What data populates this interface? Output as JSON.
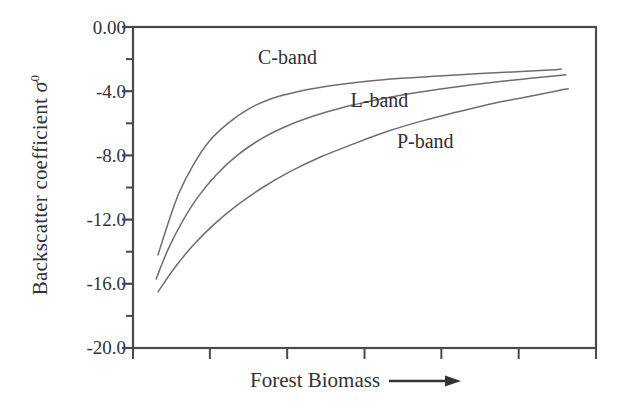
{
  "figure": {
    "background": "#ffffff",
    "axis_color": "#4a4a4a",
    "curve_color": "#6e6e6e",
    "text_color": "#333333"
  },
  "axis_labels": {
    "y_title_prefix": "Backscatter coefficient ",
    "y_title_symbol": "σ",
    "y_title_superscript": "0",
    "x_title": "Forest Biomass",
    "x_arrow": "⟶"
  },
  "chart_data": {
    "type": "line",
    "title": "",
    "subtitle": "",
    "xlabel": "Forest Biomass",
    "ylabel": "Backscatter coefficient σ⁰",
    "ylim": [
      -20.0,
      0.0
    ],
    "xlim": [
      0,
      100
    ],
    "grid": false,
    "legend_position": "inline-annotations",
    "y_ticks_major": [
      "0.00",
      "-4.0",
      "-8.0",
      "-12.0",
      "-16.0",
      "-20.0"
    ],
    "y_tick_values": [
      0.0,
      -4.0,
      -8.0,
      -12.0,
      -16.0,
      -20.0
    ],
    "y_minor_tick_values": [
      -2.0,
      -6.0,
      -10.0,
      -14.0,
      -18.0
    ],
    "x_tick_values": [
      0,
      16.6,
      33.3,
      50,
      66.6,
      83.3,
      100
    ],
    "x_tick_labels": [
      "",
      "",
      "",
      "",
      "",
      "",
      ""
    ],
    "annotations": [
      {
        "text": "C-band",
        "x": 27,
        "y": -2.0
      },
      {
        "text": "L-band",
        "x": 47,
        "y": -4.7
      },
      {
        "text": "P-band",
        "x": 57,
        "y": -7.2
      }
    ],
    "series": [
      {
        "name": "C-band",
        "color": "#6e6e6e",
        "x": [
          5.4,
          7.5,
          10.0,
          13.0,
          16.5,
          20.5,
          25.0,
          30.0,
          36.0,
          43.0,
          50.0,
          58.0,
          66.0,
          74.0,
          82.0,
          90.0,
          92.5
        ],
        "y": [
          -14.2,
          -12.3,
          -10.3,
          -8.6,
          -7.1,
          -6.0,
          -5.1,
          -4.45,
          -4.0,
          -3.65,
          -3.4,
          -3.2,
          -3.05,
          -2.92,
          -2.8,
          -2.68,
          -2.62
        ]
      },
      {
        "name": "L-band",
        "color": "#6e6e6e",
        "x": [
          5.0,
          7.5,
          10.5,
          14.0,
          18.0,
          22.5,
          27.5,
          33.0,
          39.0,
          45.5,
          52.5,
          60.0,
          68.0,
          76.0,
          84.0,
          91.0,
          93.5
        ],
        "y": [
          -15.7,
          -13.9,
          -12.2,
          -10.6,
          -9.2,
          -8.0,
          -7.0,
          -6.2,
          -5.55,
          -5.0,
          -4.55,
          -4.15,
          -3.8,
          -3.5,
          -3.25,
          -3.05,
          -2.98
        ]
      },
      {
        "name": "P-band",
        "color": "#6e6e6e",
        "x": [
          5.4,
          9.0,
          13.0,
          17.5,
          22.5,
          28.0,
          34.0,
          40.5,
          47.5,
          55.0,
          62.5,
          70.0,
          78.0,
          86.0,
          92.0,
          94.0
        ],
        "y": [
          -16.5,
          -15.0,
          -13.6,
          -12.3,
          -11.1,
          -10.0,
          -9.0,
          -8.1,
          -7.3,
          -6.5,
          -5.85,
          -5.3,
          -4.75,
          -4.3,
          -3.95,
          -3.85
        ]
      }
    ]
  }
}
